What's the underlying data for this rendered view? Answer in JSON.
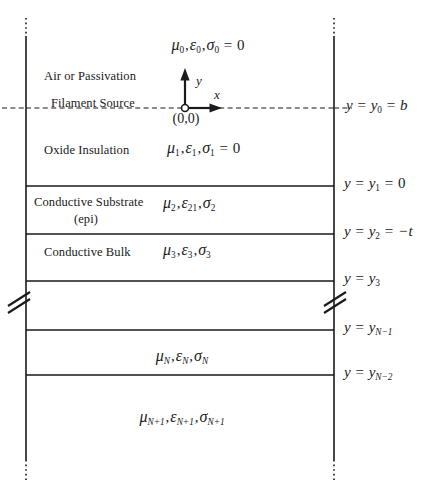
{
  "figure": {
    "type": "layered-media-cross-section-diagram",
    "background": "#ffffff",
    "line_color": "#1a1a1a"
  },
  "axes": {
    "x_label": "x",
    "y_label": "y",
    "origin_label": "(0,0)",
    "origin_marker": "open-circle"
  },
  "layers": [
    {
      "id": "layer-0",
      "name": "Air or Passivation",
      "material_label": "Air or Passivation",
      "constitutive": {
        "mu": "μ",
        "mu_sub": "0",
        "eps": "ε",
        "eps_sub": "0",
        "sigma": "σ",
        "sigma_sub": "0",
        "sigma_value": "0"
      },
      "constitutive_text": "μ0,ε0,σ0 = 0"
    },
    {
      "id": "layer-1",
      "name": "Oxide Insulation",
      "material_label": "Oxide Insulation",
      "constitutive": {
        "mu": "μ",
        "mu_sub": "1",
        "eps": "ε",
        "eps_sub": "1",
        "sigma": "σ",
        "sigma_sub": "1",
        "sigma_value": "0"
      },
      "constitutive_text": "μ1,ε1,σ1 = 0"
    },
    {
      "id": "layer-2",
      "name": "Conductive Substrate (epi)",
      "material_label": "Conductive Substrate",
      "material_label_line2": "(epi)",
      "constitutive": {
        "mu": "μ",
        "mu_sub": "2",
        "eps": "ε",
        "eps_sub": "21",
        "sigma": "σ",
        "sigma_sub": "2",
        "sigma_value": null
      },
      "constitutive_text": "μ2,ε21,σ2"
    },
    {
      "id": "layer-3",
      "name": "Conductive Bulk",
      "material_label": "Conductive Bulk",
      "constitutive": {
        "mu": "μ",
        "mu_sub": "3",
        "eps": "ε",
        "eps_sub": "3",
        "sigma": "σ",
        "sigma_sub": "3",
        "sigma_value": null
      },
      "constitutive_text": "μ3,ε3,σ3"
    },
    {
      "id": "layer-break",
      "name": "break-region",
      "material_label": "",
      "constitutive_text": ""
    },
    {
      "id": "layer-N",
      "name": "Layer N",
      "material_label": "",
      "constitutive": {
        "mu": "μ",
        "mu_sub": "N",
        "eps": "ε",
        "eps_sub": "N",
        "sigma": "σ",
        "sigma_sub": "N",
        "sigma_value": null
      },
      "constitutive_text": "μN,εN,σN"
    },
    {
      "id": "layer-N-plus-1",
      "name": "Layer N+1",
      "material_label": "",
      "constitutive": {
        "mu": "μ",
        "mu_sub": "N+1",
        "eps": "ε",
        "eps_sub": "N+1",
        "sigma": "σ",
        "sigma_sub": "N+1",
        "sigma_value": null
      },
      "constitutive_text": "μN+1,εN+1,σN+1"
    }
  ],
  "source": {
    "label": "Filament Source",
    "boundary_style": "dashed"
  },
  "boundaries": [
    {
      "id": "y0",
      "label_lhs": "y",
      "label_sub": "0",
      "label_tail": "b",
      "text": "y = y0 = b",
      "style": "dashed"
    },
    {
      "id": "y1",
      "label_lhs": "y",
      "label_sub": "1",
      "label_tail": "0",
      "text": "y = y1 = 0",
      "style": "solid"
    },
    {
      "id": "y2",
      "label_lhs": "y",
      "label_sub": "2",
      "label_tail": "−t",
      "text": "y = y2 = −t",
      "style": "solid"
    },
    {
      "id": "y3",
      "label_lhs": "y",
      "label_sub": "3",
      "label_tail": null,
      "text": "y = y3",
      "style": "solid"
    },
    {
      "id": "yN-1",
      "label_lhs": "y",
      "label_sub": "N−1",
      "label_tail": null,
      "text": "y = yN−1",
      "style": "solid"
    },
    {
      "id": "yN-2",
      "label_lhs": "y",
      "label_sub": "N−2",
      "label_tail": null,
      "text": "y = yN−2",
      "style": "solid"
    }
  ],
  "break_symbol": {
    "name": "axis-break",
    "count": 2,
    "glyph": "double-slash"
  }
}
